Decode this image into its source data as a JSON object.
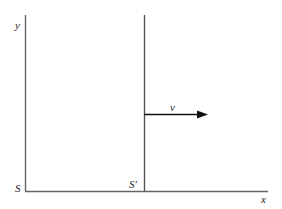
{
  "diagram": {
    "labels": {
      "y_axis": "y",
      "x_axis": "x",
      "origin_S": "S",
      "origin_S_prime": "S′",
      "velocity": "v"
    },
    "colors": {
      "line": "#555555",
      "arrow": "#111111",
      "background": "#ffffff"
    }
  }
}
